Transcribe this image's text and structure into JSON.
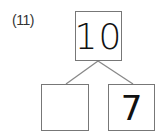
{
  "problem": {
    "number_label": "(11)",
    "top_value": "10",
    "bottom_left_value": "",
    "bottom_right_value": "7"
  }
}
